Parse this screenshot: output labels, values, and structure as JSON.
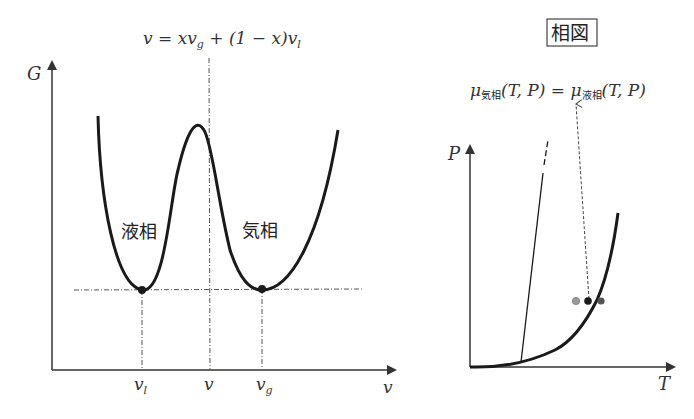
{
  "left_panel": {
    "formula": "v = xv",
    "formula_sub_g": "g",
    "formula_mid": " + (1 − x)v",
    "formula_sub_l": "l",
    "y_axis_label": "G",
    "x_axis_label": "v",
    "tick_vl": "v",
    "tick_vl_sub": "l",
    "tick_v": "v",
    "tick_vg": "v",
    "tick_vg_sub": "g",
    "liquid_label": "液相",
    "gas_label": "気相"
  },
  "right_panel": {
    "boxed_title": "相図",
    "equation_mu": "μ",
    "equation_sub_gas": "気相",
    "equation_args": "(T, P) = ",
    "equation_sub_liquid": "液相",
    "equation_args2": "(T, P)",
    "y_axis_label": "P",
    "x_axis_label": "T"
  },
  "colors": {
    "curve": "#1a1a1a",
    "axis": "#333333",
    "guide": "#555555",
    "dot_light": "#9a9a9a",
    "dot_dark": "#555555"
  }
}
